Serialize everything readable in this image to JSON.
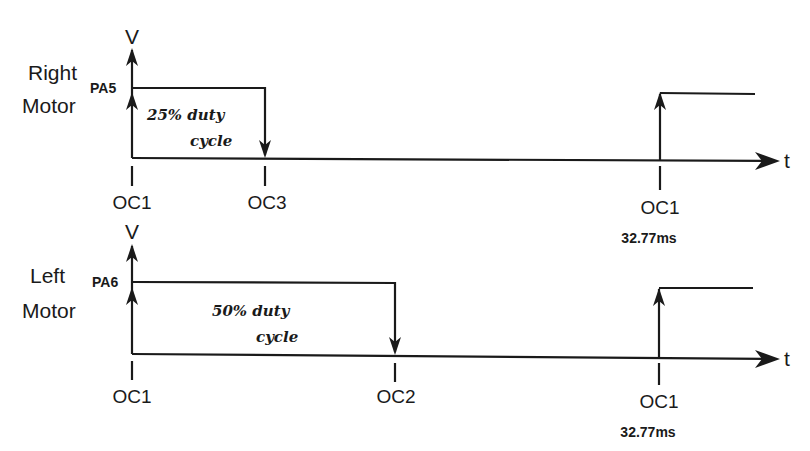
{
  "diagram": {
    "type": "timing-diagram",
    "axes": {
      "y_label": "V",
      "x_label": "t"
    },
    "panels": [
      {
        "id": "right-motor",
        "label_line1": "Right",
        "label_line2": "Motor",
        "pin": "PA5",
        "duty_line1": "25% duty",
        "duty_line2": "cycle",
        "duty_percent": 25,
        "markers": [
          {
            "label": "OC1",
            "sub": ""
          },
          {
            "label": "OC3",
            "sub": ""
          },
          {
            "label": "OC1",
            "sub": "32.77ms"
          }
        ]
      },
      {
        "id": "left-motor",
        "label_line1": "Left",
        "label_line2": "Motor",
        "pin": "PA6",
        "duty_line1": "50% duty",
        "duty_line2": "cycle",
        "duty_percent": 50,
        "markers": [
          {
            "label": "OC1",
            "sub": ""
          },
          {
            "label": "OC2",
            "sub": ""
          },
          {
            "label": "OC1",
            "sub": "32.77ms"
          }
        ]
      }
    ]
  }
}
